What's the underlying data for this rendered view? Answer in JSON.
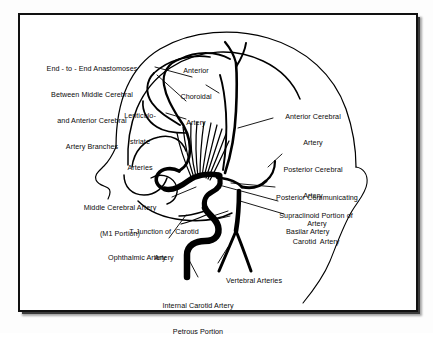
{
  "figure": {
    "domain": "anatomical-diagram",
    "ink_color": "#000000",
    "background_color": "#ffffff",
    "frame_color": "#111111"
  },
  "labels": [
    {
      "id": "end-to-end-anastomoses",
      "lines": [
        "End - to - End Anastomoses",
        "Between Middle Cerebral",
        "and Anterior Cerebral",
        "Artery Branches"
      ],
      "align": "center"
    },
    {
      "id": "anterior-choroidal-artery",
      "lines": [
        "Anterior",
        "Choroidal",
        "Artery"
      ],
      "align": "center"
    },
    {
      "id": "lenticulostriate-arteries",
      "lines": [
        "Lenticulo-",
        "striate",
        "Arteries"
      ],
      "align": "center"
    },
    {
      "id": "anterior-cerebral-artery",
      "lines": [
        "Anterior Cerebral",
        "Artery"
      ],
      "align": "center"
    },
    {
      "id": "posterior-cerebral-artery",
      "lines": [
        "Posterior Cerebral",
        "Artery"
      ],
      "align": "center"
    },
    {
      "id": "posterior-communicating-artery",
      "lines": [
        "Posterior Communicating",
        "Artery"
      ],
      "align": "center"
    },
    {
      "id": "supraclinoid-portion-of-carotid-artery",
      "lines": [
        "Supraclinoid Portion of",
        "Carotid  Artery"
      ],
      "align": "center"
    },
    {
      "id": "basilar-artery",
      "lines": [
        "Basilar Artery"
      ],
      "align": "left"
    },
    {
      "id": "middle-cerebral-artery-m1",
      "lines": [
        "Middle Cerebral Artery",
        "(M1 Portion)"
      ],
      "align": "center"
    },
    {
      "id": "t-junction-of-carotid-artery",
      "lines": [
        "T-Junction of  Carotid",
        "Artery"
      ],
      "align": "center"
    },
    {
      "id": "ophthalmic-artery",
      "lines": [
        "Ophthalmic Artery"
      ],
      "align": "right"
    },
    {
      "id": "vertebral-arteries",
      "lines": [
        "Vertebral Arteries"
      ],
      "align": "left"
    },
    {
      "id": "internal-carotid-artery-petrous",
      "lines": [
        "Internal Carotid Artery",
        "Petrous Portion"
      ],
      "align": "center"
    }
  ]
}
